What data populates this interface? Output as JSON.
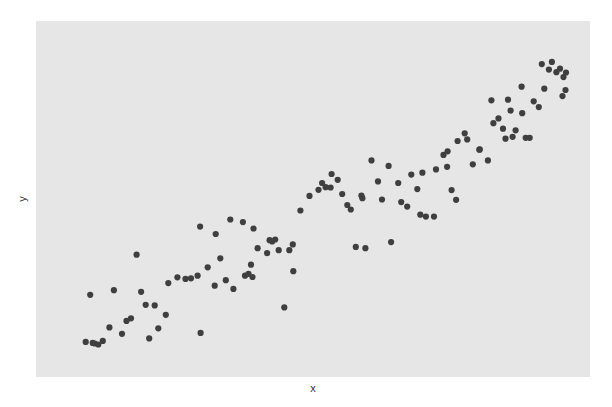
{
  "chart_data": {
    "type": "scatter",
    "title": "",
    "xlabel": "x",
    "ylabel": "y",
    "xlim": [
      0,
      100
    ],
    "ylim": [
      0,
      100
    ],
    "grid": false,
    "legend": null,
    "tick_labels_visible": false,
    "colors": {
      "panel": "#e6e6e6",
      "point": "#3f3f3f",
      "background": "#ffffff"
    },
    "points": [
      [
        4.7,
        5.6
      ],
      [
        5.6,
        20.2
      ],
      [
        6.1,
        5.3
      ],
      [
        6.5,
        5.1
      ],
      [
        7.2,
        4.8
      ],
      [
        8.1,
        5.9
      ],
      [
        9.4,
        10.1
      ],
      [
        10.3,
        21.6
      ],
      [
        11.9,
        8.1
      ],
      [
        12.8,
        12.1
      ],
      [
        13.7,
        12.9
      ],
      [
        14.8,
        32.6
      ],
      [
        15.7,
        21.1
      ],
      [
        16.6,
        17.1
      ],
      [
        17.3,
        6.7
      ],
      [
        18.4,
        16.9
      ],
      [
        19.1,
        9.8
      ],
      [
        20.6,
        14.0
      ],
      [
        21.1,
        23.8
      ],
      [
        22.9,
        25.6
      ],
      [
        24.5,
        25.1
      ],
      [
        25.6,
        25.3
      ],
      [
        26.9,
        26.1
      ],
      [
        27.4,
        41.3
      ],
      [
        27.5,
        8.4
      ],
      [
        28.9,
        28.7
      ],
      [
        30.3,
        23.0
      ],
      [
        30.5,
        39.0
      ],
      [
        31.4,
        31.5
      ],
      [
        32.5,
        24.7
      ],
      [
        33.4,
        43.5
      ],
      [
        34.0,
        22.0
      ],
      [
        35.9,
        42.7
      ],
      [
        36.3,
        26.1
      ],
      [
        37.0,
        26.7
      ],
      [
        37.5,
        29.5
      ],
      [
        37.8,
        25.7
      ],
      [
        38.0,
        40.7
      ],
      [
        38.8,
        34.6
      ],
      [
        40.7,
        33.1
      ],
      [
        41.2,
        37.1
      ],
      [
        41.7,
        36.7
      ],
      [
        42.3,
        37.3
      ],
      [
        43.0,
        34.0
      ],
      [
        44.1,
        16.3
      ],
      [
        45.1,
        34.0
      ],
      [
        45.9,
        27.5
      ],
      [
        45.8,
        35.8
      ],
      [
        47.3,
        46.3
      ],
      [
        49.1,
        50.8
      ],
      [
        50.9,
        52.7
      ],
      [
        51.6,
        54.8
      ],
      [
        52.3,
        53.5
      ],
      [
        53.3,
        53.4
      ],
      [
        53.5,
        57.6
      ],
      [
        54.7,
        55.8
      ],
      [
        55.6,
        51.4
      ],
      [
        56.6,
        48.0
      ],
      [
        57.3,
        46.6
      ],
      [
        58.3,
        35.0
      ],
      [
        59.4,
        50.9
      ],
      [
        59.6,
        50.1
      ],
      [
        60.2,
        34.6
      ],
      [
        61.4,
        61.8
      ],
      [
        62.7,
        55.3
      ],
      [
        63.5,
        49.7
      ],
      [
        64.8,
        60.1
      ],
      [
        65.3,
        36.5
      ],
      [
        66.7,
        54.8
      ],
      [
        67.3,
        48.9
      ],
      [
        68.5,
        47.5
      ],
      [
        69.3,
        57.4
      ],
      [
        70.5,
        52.9
      ],
      [
        71.1,
        45.0
      ],
      [
        71.5,
        58.0
      ],
      [
        72.2,
        44.4
      ],
      [
        73.8,
        44.4
      ],
      [
        74.2,
        59.0
      ],
      [
        75.7,
        63.5
      ],
      [
        76.5,
        64.6
      ],
      [
        76.4,
        59.8
      ],
      [
        77.3,
        52.6
      ],
      [
        78.2,
        49.6
      ],
      [
        78.5,
        67.8
      ],
      [
        79.9,
        70.2
      ],
      [
        80.4,
        68.3
      ],
      [
        81.5,
        60.6
      ],
      [
        82.8,
        65.1
      ],
      [
        82.9,
        65.2
      ],
      [
        84.5,
        61.8
      ],
      [
        85.2,
        80.4
      ],
      [
        85.6,
        73.3
      ],
      [
        86.6,
        74.8
      ],
      [
        87.5,
        71.6
      ],
      [
        88.0,
        68.5
      ],
      [
        88.5,
        80.6
      ],
      [
        89.0,
        77.2
      ],
      [
        89.4,
        69.1
      ],
      [
        90.0,
        71.1
      ],
      [
        91.2,
        84.6
      ],
      [
        91.3,
        76.4
      ],
      [
        92.0,
        68.8
      ],
      [
        92.8,
        68.8
      ],
      [
        93.6,
        80.1
      ],
      [
        94.6,
        78.3
      ],
      [
        95.2,
        91.6
      ],
      [
        95.7,
        84.0
      ],
      [
        96.6,
        89.9
      ],
      [
        97.2,
        92.3
      ],
      [
        98.1,
        89.1
      ],
      [
        98.8,
        90.2
      ],
      [
        99.5,
        87.6
      ],
      [
        100.0,
        89.0
      ],
      [
        99.3,
        81.7
      ],
      [
        99.9,
        83.6
      ]
    ]
  }
}
